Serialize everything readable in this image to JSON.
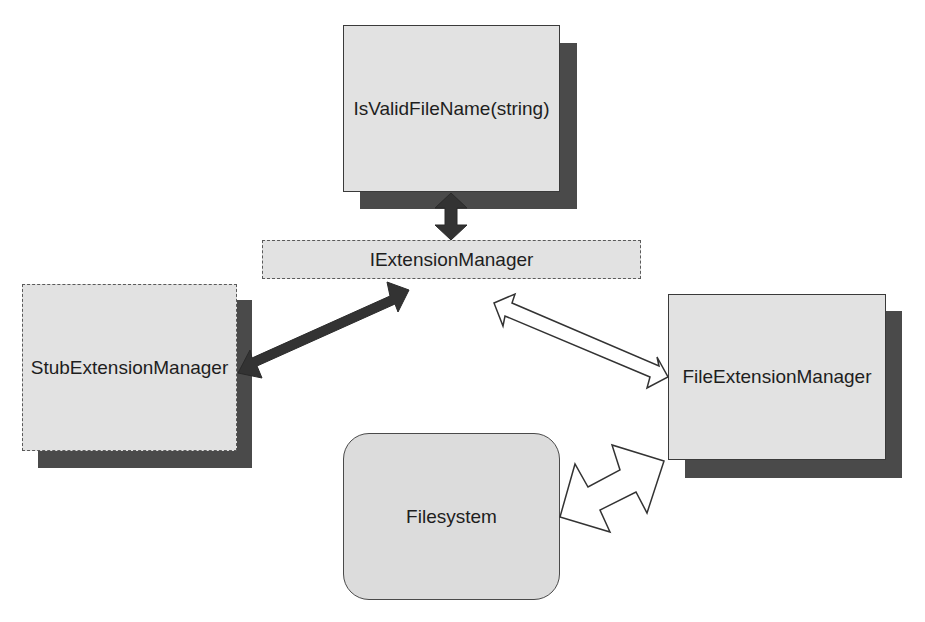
{
  "diagram": {
    "nodes": [
      {
        "id": "isvalid",
        "label": "IsValidFileName(string)",
        "style": "solid",
        "shadow": true
      },
      {
        "id": "iface",
        "label": "IExtensionManager",
        "style": "dashed",
        "shadow": false
      },
      {
        "id": "stub",
        "label": "StubExtensionManager",
        "style": "dashed",
        "shadow": true
      },
      {
        "id": "file",
        "label": "FileExtensionManager",
        "style": "solid",
        "shadow": true
      },
      {
        "id": "fs",
        "label": "Filesystem",
        "style": "rounded",
        "shadow": false
      }
    ],
    "edges": [
      {
        "from": "isvalid",
        "to": "iface",
        "type": "bidirectional",
        "fill": "dark"
      },
      {
        "from": "stub",
        "to": "iface",
        "type": "bidirectional",
        "fill": "dark"
      },
      {
        "from": "iface",
        "to": "file",
        "type": "bidirectional",
        "fill": "hollow"
      },
      {
        "from": "fs",
        "to": "file",
        "type": "bidirectional-lightning",
        "fill": "hollow"
      }
    ],
    "colors": {
      "box_fill": "#e2e2e2",
      "shadow": "#4a4a4a",
      "border": "#3a3a3a",
      "dark_arrow": "#333333",
      "hollow_arrow_stroke": "#333333"
    }
  }
}
